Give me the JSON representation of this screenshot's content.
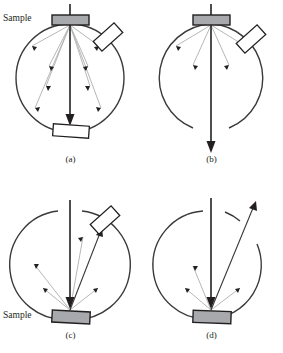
{
  "figure": {
    "panels": [
      {
        "id": "a",
        "caption": "(a)",
        "sample_label": "Sample",
        "sample_position": "top",
        "detector_tilted": true,
        "detector_flat": true,
        "beam": "downward through center",
        "scattered_rays": 8,
        "circle_gaps": "none"
      },
      {
        "id": "b",
        "caption": "(b)",
        "sample_label": "",
        "sample_position": "top",
        "detector_tilted": true,
        "detector_flat": false,
        "beam": "downward exiting bottom gap",
        "scattered_rays": 4,
        "circle_gaps": "bottom"
      },
      {
        "id": "c",
        "caption": "(c)",
        "sample_label": "Sample",
        "sample_position": "bottom",
        "detector_tilted": true,
        "detector_flat": false,
        "beam": "downward through center",
        "scattered_rays": 5,
        "circle_gaps": "top"
      },
      {
        "id": "d",
        "caption": "(d)",
        "sample_label": "",
        "sample_position": "bottom",
        "detector_tilted": false,
        "detector_flat": false,
        "beam": "downward to sample, reflected out upper-right gap",
        "scattered_rays": 4,
        "circle_gaps": "top, upper-right"
      }
    ],
    "colors": {
      "circle_stroke": "#3a3a3c",
      "sample_fill": "#a7a9ac",
      "sample_stroke": "#231f20",
      "detector_fill": "#ffffff",
      "detector_stroke": "#231f20",
      "beam_arrow": "#3a3a3c",
      "ray_line": "#b5b7b9",
      "ray_head": "#231f20",
      "background": "#ffffff"
    }
  }
}
